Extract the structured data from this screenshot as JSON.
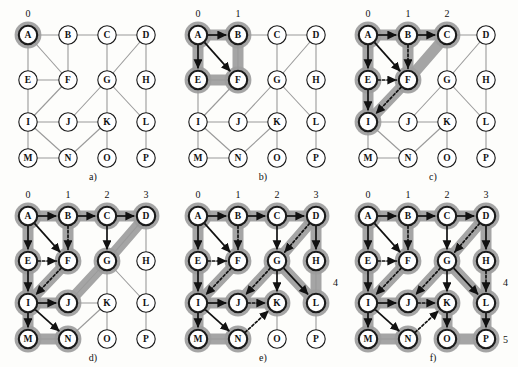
{
  "figure": {
    "node_labels": [
      "A",
      "B",
      "C",
      "D",
      "E",
      "F",
      "G",
      "H",
      "I",
      "J",
      "K",
      "L",
      "M",
      "N",
      "O",
      "P"
    ],
    "graph_edges": [
      [
        "A",
        "B"
      ],
      [
        "B",
        "C"
      ],
      [
        "C",
        "D"
      ],
      [
        "A",
        "E"
      ],
      [
        "A",
        "F"
      ],
      [
        "B",
        "F"
      ],
      [
        "E",
        "F"
      ],
      [
        "E",
        "I"
      ],
      [
        "F",
        "I"
      ],
      [
        "C",
        "G"
      ],
      [
        "D",
        "G"
      ],
      [
        "D",
        "H"
      ],
      [
        "G",
        "J"
      ],
      [
        "G",
        "K"
      ],
      [
        "G",
        "L"
      ],
      [
        "H",
        "L"
      ],
      [
        "I",
        "J"
      ],
      [
        "J",
        "K"
      ],
      [
        "I",
        "M"
      ],
      [
        "I",
        "N"
      ],
      [
        "M",
        "N"
      ],
      [
        "N",
        "K"
      ],
      [
        "K",
        "O"
      ],
      [
        "L",
        "P"
      ]
    ],
    "node_grid": {
      "A": [
        0,
        0
      ],
      "B": [
        1,
        0
      ],
      "C": [
        2,
        0
      ],
      "D": [
        3,
        0
      ],
      "E": [
        0,
        1
      ],
      "F": [
        1,
        1
      ],
      "G": [
        2,
        1
      ],
      "H": [
        3,
        1
      ],
      "I": [
        0,
        2
      ],
      "J": [
        1,
        2
      ],
      "K": [
        2,
        2
      ],
      "L": [
        3,
        2
      ],
      "M": [
        0,
        3
      ],
      "N": [
        1,
        3
      ],
      "O": [
        2,
        3
      ],
      "P": [
        3,
        3
      ]
    }
  },
  "panels": [
    {
      "id": "a",
      "caption": "a)",
      "level_labels": [
        {
          "text": "0",
          "col": 0
        }
      ],
      "side_labels": [],
      "visited": [
        "A"
      ],
      "tree_edges": [],
      "dashed_edges": [],
      "frontier_nodes": [
        "A"
      ],
      "frontier_links": []
    },
    {
      "id": "b",
      "caption": "b)",
      "level_labels": [
        {
          "text": "0",
          "col": 0
        },
        {
          "text": "1",
          "col": 1
        }
      ],
      "side_labels": [],
      "visited": [
        "A",
        "B",
        "E",
        "F"
      ],
      "tree_edges": [
        [
          "A",
          "B"
        ],
        [
          "A",
          "E"
        ],
        [
          "A",
          "F"
        ]
      ],
      "dashed_edges": [],
      "frontier_nodes": [
        "A",
        "B",
        "E",
        "F"
      ],
      "frontier_links": [
        [
          "A",
          "B"
        ],
        [
          "B",
          "F"
        ],
        [
          "F",
          "E"
        ],
        [
          "E",
          "A"
        ]
      ]
    },
    {
      "id": "c",
      "caption": "c)",
      "level_labels": [
        {
          "text": "0",
          "col": 0
        },
        {
          "text": "1",
          "col": 1
        },
        {
          "text": "2",
          "col": 2
        }
      ],
      "side_labels": [],
      "visited": [
        "A",
        "B",
        "C",
        "E",
        "F",
        "I"
      ],
      "tree_edges": [
        [
          "A",
          "B"
        ],
        [
          "B",
          "C"
        ],
        [
          "A",
          "E"
        ],
        [
          "A",
          "F"
        ],
        [
          "E",
          "I"
        ]
      ],
      "dashed_edges": [
        [
          "B",
          "F"
        ],
        [
          "E",
          "F"
        ],
        [
          "F",
          "I"
        ]
      ],
      "frontier_nodes": [
        "A",
        "B",
        "C",
        "E",
        "F",
        "I"
      ],
      "frontier_links": [
        [
          "A",
          "B"
        ],
        [
          "B",
          "C"
        ],
        [
          "A",
          "E"
        ],
        [
          "E",
          "I"
        ],
        [
          "B",
          "F"
        ],
        [
          "F",
          "I"
        ],
        [
          "C",
          "F"
        ]
      ]
    },
    {
      "id": "d",
      "caption": "d)",
      "level_labels": [
        {
          "text": "0",
          "col": 0
        },
        {
          "text": "1",
          "col": 1
        },
        {
          "text": "2",
          "col": 2
        },
        {
          "text": "3",
          "col": 3
        }
      ],
      "side_labels": [],
      "visited": [
        "A",
        "B",
        "C",
        "D",
        "E",
        "F",
        "G",
        "I",
        "J",
        "M",
        "N"
      ],
      "tree_edges": [
        [
          "A",
          "B"
        ],
        [
          "B",
          "C"
        ],
        [
          "C",
          "D"
        ],
        [
          "A",
          "E"
        ],
        [
          "A",
          "F"
        ],
        [
          "E",
          "I"
        ],
        [
          "C",
          "G"
        ],
        [
          "I",
          "J"
        ],
        [
          "I",
          "M"
        ],
        [
          "I",
          "N"
        ]
      ],
      "dashed_edges": [
        [
          "B",
          "F"
        ],
        [
          "E",
          "F"
        ],
        [
          "F",
          "I"
        ]
      ],
      "frontier_nodes": [
        "A",
        "B",
        "C",
        "D",
        "E",
        "F",
        "G",
        "I",
        "J",
        "M",
        "N"
      ],
      "frontier_links": [
        [
          "A",
          "B"
        ],
        [
          "B",
          "C"
        ],
        [
          "C",
          "D"
        ],
        [
          "A",
          "E"
        ],
        [
          "E",
          "I"
        ],
        [
          "B",
          "F"
        ],
        [
          "F",
          "I"
        ],
        [
          "I",
          "J"
        ],
        [
          "I",
          "M"
        ],
        [
          "M",
          "N"
        ],
        [
          "D",
          "G"
        ],
        [
          "G",
          "J"
        ]
      ]
    },
    {
      "id": "e",
      "caption": "e)",
      "level_labels": [
        {
          "text": "0",
          "col": 0
        },
        {
          "text": "1",
          "col": 1
        },
        {
          "text": "2",
          "col": 2
        },
        {
          "text": "3",
          "col": 3
        }
      ],
      "side_labels": [
        {
          "text": "4",
          "col": 3,
          "row": 1.5
        }
      ],
      "visited": [
        "A",
        "B",
        "C",
        "D",
        "E",
        "F",
        "G",
        "H",
        "I",
        "J",
        "K",
        "L",
        "M",
        "N"
      ],
      "tree_edges": [
        [
          "A",
          "B"
        ],
        [
          "B",
          "C"
        ],
        [
          "C",
          "D"
        ],
        [
          "A",
          "E"
        ],
        [
          "A",
          "F"
        ],
        [
          "E",
          "I"
        ],
        [
          "C",
          "G"
        ],
        [
          "I",
          "J"
        ],
        [
          "I",
          "M"
        ],
        [
          "I",
          "N"
        ],
        [
          "D",
          "H"
        ],
        [
          "G",
          "K"
        ],
        [
          "G",
          "L"
        ]
      ],
      "dashed_edges": [
        [
          "B",
          "F"
        ],
        [
          "E",
          "F"
        ],
        [
          "F",
          "I"
        ],
        [
          "D",
          "G"
        ],
        [
          "G",
          "J"
        ],
        [
          "J",
          "K"
        ],
        [
          "N",
          "K"
        ]
      ],
      "frontier_nodes": [
        "A",
        "B",
        "C",
        "D",
        "E",
        "F",
        "G",
        "H",
        "I",
        "J",
        "K",
        "L",
        "M",
        "N"
      ],
      "frontier_links": [
        [
          "A",
          "B"
        ],
        [
          "B",
          "C"
        ],
        [
          "C",
          "D"
        ],
        [
          "A",
          "E"
        ],
        [
          "E",
          "I"
        ],
        [
          "B",
          "F"
        ],
        [
          "F",
          "I"
        ],
        [
          "I",
          "J"
        ],
        [
          "I",
          "M"
        ],
        [
          "M",
          "N"
        ],
        [
          "D",
          "G"
        ],
        [
          "G",
          "J"
        ],
        [
          "D",
          "H"
        ],
        [
          "H",
          "L"
        ],
        [
          "G",
          "L"
        ],
        [
          "J",
          "K"
        ]
      ]
    },
    {
      "id": "f",
      "caption": "f)",
      "level_labels": [
        {
          "text": "0",
          "col": 0
        },
        {
          "text": "1",
          "col": 1
        },
        {
          "text": "2",
          "col": 2
        },
        {
          "text": "3",
          "col": 3
        }
      ],
      "side_labels": [
        {
          "text": "4",
          "col": 3,
          "row": 1.5
        },
        {
          "text": "5",
          "col": 3,
          "row": 3
        }
      ],
      "visited": [
        "A",
        "B",
        "C",
        "D",
        "E",
        "F",
        "G",
        "H",
        "I",
        "J",
        "K",
        "L",
        "M",
        "N",
        "O",
        "P"
      ],
      "tree_edges": [
        [
          "A",
          "B"
        ],
        [
          "B",
          "C"
        ],
        [
          "C",
          "D"
        ],
        [
          "A",
          "E"
        ],
        [
          "A",
          "F"
        ],
        [
          "E",
          "I"
        ],
        [
          "C",
          "G"
        ],
        [
          "I",
          "J"
        ],
        [
          "I",
          "M"
        ],
        [
          "I",
          "N"
        ],
        [
          "D",
          "H"
        ],
        [
          "G",
          "K"
        ],
        [
          "G",
          "L"
        ],
        [
          "K",
          "O"
        ],
        [
          "L",
          "P"
        ]
      ],
      "dashed_edges": [
        [
          "B",
          "F"
        ],
        [
          "E",
          "F"
        ],
        [
          "F",
          "I"
        ],
        [
          "D",
          "G"
        ],
        [
          "G",
          "J"
        ],
        [
          "J",
          "K"
        ],
        [
          "N",
          "K"
        ],
        [
          "H",
          "L"
        ]
      ],
      "frontier_nodes": [
        "A",
        "B",
        "C",
        "D",
        "E",
        "F",
        "G",
        "H",
        "I",
        "J",
        "K",
        "L",
        "M",
        "N",
        "O",
        "P"
      ],
      "frontier_links": [
        [
          "A",
          "B"
        ],
        [
          "B",
          "C"
        ],
        [
          "C",
          "D"
        ],
        [
          "A",
          "E"
        ],
        [
          "E",
          "I"
        ],
        [
          "B",
          "F"
        ],
        [
          "F",
          "I"
        ],
        [
          "I",
          "J"
        ],
        [
          "I",
          "M"
        ],
        [
          "M",
          "N"
        ],
        [
          "D",
          "G"
        ],
        [
          "G",
          "J"
        ],
        [
          "D",
          "H"
        ],
        [
          "H",
          "L"
        ],
        [
          "G",
          "L"
        ],
        [
          "J",
          "K"
        ],
        [
          "K",
          "O"
        ],
        [
          "O",
          "P"
        ],
        [
          "L",
          "P"
        ]
      ]
    }
  ],
  "colors": {
    "highlight": "#9d9d9d",
    "node_fill": "#ffffff",
    "node_stroke": "#1a1a1a",
    "plain_edge": "#9a9a9a",
    "tree_edge": "#111111",
    "background": "#fdfdfb"
  }
}
